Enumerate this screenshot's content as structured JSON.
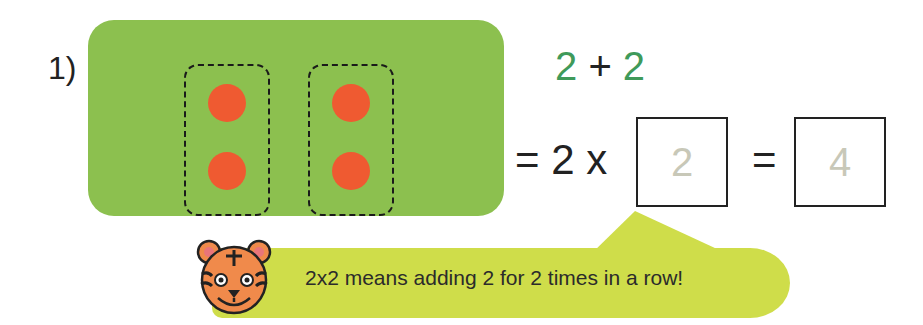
{
  "question": {
    "number_label": "1)",
    "groups": [
      {
        "dots": 2
      },
      {
        "dots": 2
      }
    ],
    "addition": {
      "left": "2",
      "operator": "+",
      "right": "2"
    },
    "multiplication": {
      "prefix": "=",
      "factor": "2",
      "times": "x",
      "answer_box_1": "2",
      "equals": "=",
      "answer_box_2": "4"
    }
  },
  "hint": {
    "mascot": "tiger-face-icon",
    "text": "2x2 means adding 2 for 2 times in a row!"
  },
  "colors": {
    "panel": "#8cc04f",
    "dot": "#ef5a31",
    "addend": "#3f9a5a",
    "bubble": "#cfdd4a",
    "answer_text": "#c8c8b8"
  }
}
